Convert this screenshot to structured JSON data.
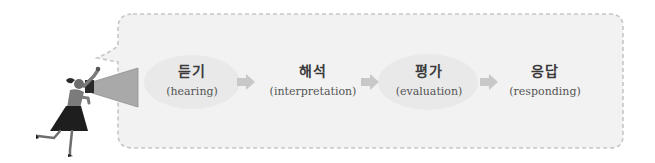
{
  "diagram": {
    "colors": {
      "box_fill": "#f2f2f2",
      "box_border": "#c6c6c6",
      "arrow": "#c8c8c8",
      "ellipse": "#e9e9e9",
      "text_ko": "#3a3a3a",
      "text_en": "#555555",
      "megaphone": "#a9a9a9",
      "skirt": "#1e1e1e"
    },
    "steps": [
      {
        "ko": "듣기",
        "en": "(hearing)",
        "highlighted": true
      },
      {
        "ko": "해석",
        "en": "(interpretation)",
        "highlighted": false
      },
      {
        "ko": "평가",
        "en": "(evaluation)",
        "highlighted": true
      },
      {
        "ko": "응답",
        "en": "(responding)",
        "highlighted": false
      }
    ],
    "icons": {
      "speaker": "girl-with-megaphone-icon",
      "arrow": "right-arrow-icon"
    }
  }
}
